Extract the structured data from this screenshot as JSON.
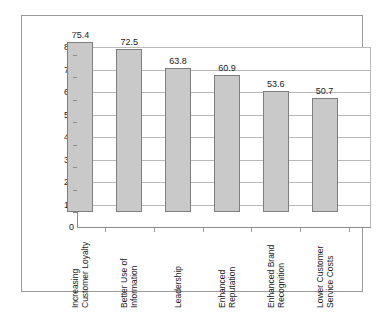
{
  "chart_data": {
    "type": "bar",
    "title": "",
    "subtitle": "",
    "xlabel": "",
    "ylabel": "",
    "ylim": [
      0,
      80
    ],
    "ytick_step": 10,
    "yticks": [
      "0",
      "10",
      "20",
      "30",
      "40",
      "50",
      "60",
      "70",
      "80"
    ],
    "grid": true,
    "legend": "none",
    "orientation": "vertical",
    "categories": [
      "Increasing Customer Loyalty",
      "Better Use of Information",
      "Leadership",
      "Enhanced Reputation",
      "Enhanced Brand Recognition",
      "Lower Customer Service Costs"
    ],
    "category_lines": [
      [
        "Increasing",
        "Customer Loyalty"
      ],
      [
        "Better Use of",
        "Information"
      ],
      [
        "Leadership"
      ],
      [
        "Enhanced",
        "Reputation"
      ],
      [
        "Enhanced Brand",
        "Recognition"
      ],
      [
        "Lower Customer",
        "Service Costs"
      ]
    ],
    "values": [
      75.4,
      72.5,
      63.8,
      60.9,
      53.6,
      50.7
    ],
    "value_labels": [
      "75.4",
      "72.5",
      "63.8",
      "60.9",
      "53.6",
      "50.7"
    ],
    "colors": {
      "bar_fill": "#c9c9c9",
      "bar_stroke": "#7e7e7e",
      "grid": "#b9b9b9",
      "axis": "#8d8d8d",
      "frame": "#9a9a9a",
      "text": "#1a1a1a",
      "background": "#ffffff"
    }
  }
}
